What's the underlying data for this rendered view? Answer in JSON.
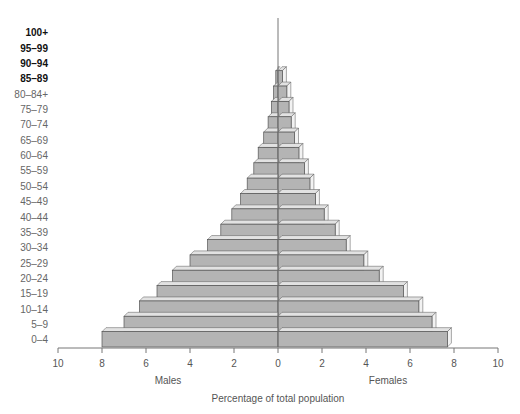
{
  "chart_data": {
    "type": "bar",
    "subtype": "population-pyramid",
    "title": "",
    "xlabel": "Percentage of total population",
    "left_label": "Males",
    "right_label": "Females",
    "xlim": [
      -10,
      10
    ],
    "x_ticks": [
      "10",
      "8",
      "6",
      "4",
      "2",
      "0",
      "2",
      "4",
      "6",
      "8",
      "10"
    ],
    "categories": [
      "0–4",
      "5–9",
      "10–14",
      "15–19",
      "20–24",
      "25–29",
      "30–34",
      "35–39",
      "40–44",
      "45–49",
      "50–54",
      "55–59",
      "60–64",
      "65–69",
      "70–74",
      "75–79",
      "80–84+",
      "85–89",
      "90–94",
      "95–99",
      "100+"
    ],
    "bold_categories": [
      "85–89",
      "90–94",
      "95–99",
      "100+"
    ],
    "series": [
      {
        "name": "Males",
        "values": [
          8.0,
          7.0,
          6.3,
          5.5,
          4.8,
          4.0,
          3.2,
          2.6,
          2.1,
          1.7,
          1.4,
          1.1,
          0.9,
          0.65,
          0.45,
          0.3,
          0.2,
          0.1,
          0,
          0,
          0
        ]
      },
      {
        "name": "Females",
        "values": [
          7.7,
          7.0,
          6.4,
          5.7,
          4.6,
          3.9,
          3.1,
          2.6,
          2.1,
          1.7,
          1.45,
          1.2,
          0.95,
          0.75,
          0.6,
          0.5,
          0.4,
          0.2,
          0,
          0,
          0
        ]
      }
    ],
    "grid": false,
    "legend": "none",
    "colors": {
      "bar": "#b4b4b4",
      "bar_top": "#e2e2e2",
      "bar_side": "#f2f2f2",
      "outline": "#555555",
      "axis": "#777777"
    }
  }
}
